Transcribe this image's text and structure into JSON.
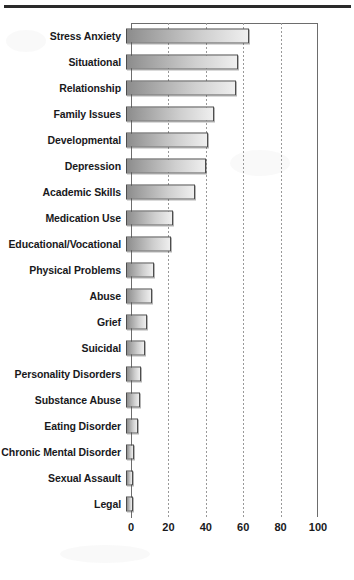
{
  "page": {
    "divider": "top-rule"
  },
  "chart_data": {
    "type": "bar",
    "orientation": "horizontal",
    "title": "",
    "subtitle": "",
    "xlabel": "",
    "ylabel": "",
    "xlim": [
      0,
      100
    ],
    "xticks": [
      0,
      20,
      40,
      60,
      80,
      100
    ],
    "xtick_labels": [
      "0",
      "20",
      "40",
      "60",
      "80",
      "100"
    ],
    "grid": "vertical-dotted",
    "legend": "none",
    "bar_color_left": "#8c8c8c",
    "bar_color_right": "#efefef",
    "bar_border_color": "#4d4d4d",
    "axis_color": "#6d6d6d",
    "categories": [
      "Stress Anxiety",
      "Situational",
      "Relationship",
      "Family Issues",
      "Developmental",
      "Depression",
      "Academic Skills",
      "Medication Use",
      "Educational/Vocational",
      "Physical Problems",
      "Abuse",
      "Grief",
      "Suicidal",
      "Personality Disorders",
      "Substance Abuse",
      "Eating Disorder",
      "Chronic Mental Disorder",
      "Sexual Assault",
      "Legal"
    ],
    "values": [
      66,
      60,
      59,
      47,
      44,
      43,
      37,
      25,
      24,
      15,
      14,
      11,
      10,
      8,
      7.5,
      6.5,
      4.5,
      4,
      4
    ]
  }
}
